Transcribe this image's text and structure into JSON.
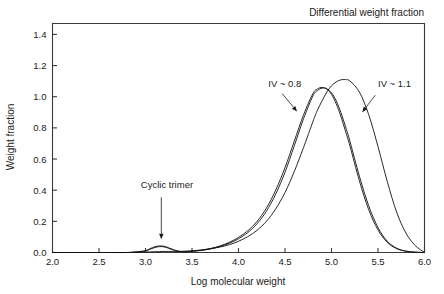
{
  "chart_data": {
    "type": "line",
    "title": "Differential weight fraction",
    "xlabel": "Log molecular weight",
    "ylabel": "Weight fraction",
    "xlim": [
      2.0,
      6.0
    ],
    "ylim": [
      0.0,
      1.47
    ],
    "grid": false,
    "legend_position": "none",
    "xticks": [
      "2.0",
      "2.5",
      "3.0",
      "3.5",
      "4.0",
      "4.5",
      "5.0",
      "5.5",
      "6.0"
    ],
    "xtick_values": [
      2.0,
      2.5,
      3.0,
      3.5,
      4.0,
      4.5,
      5.0,
      5.5,
      6.0
    ],
    "yticks": [
      "0.0",
      "0.2",
      "0.4",
      "0.6",
      "0.8",
      "1.0",
      "1.2",
      "1.4"
    ],
    "ytick_values": [
      0.0,
      0.2,
      0.4,
      0.6,
      0.8,
      1.0,
      1.2,
      1.4
    ],
    "x": [
      2.0,
      2.2,
      2.4,
      2.6,
      2.8,
      2.9,
      3.0,
      3.05,
      3.1,
      3.15,
      3.2,
      3.25,
      3.3,
      3.35,
      3.4,
      3.5,
      3.6,
      3.7,
      3.8,
      3.9,
      4.0,
      4.1,
      4.2,
      4.3,
      4.4,
      4.5,
      4.6,
      4.7,
      4.8,
      4.85,
      4.9,
      4.95,
      5.0,
      5.05,
      5.1,
      5.15,
      5.2,
      5.3,
      5.4,
      5.5,
      5.6,
      5.7,
      5.8,
      5.9,
      6.0
    ],
    "series": [
      {
        "name": "IV ~ 0.8 (a)",
        "label": "IV ~ 0.8",
        "peak_x": 4.88,
        "peak_y": 1.06,
        "values": [
          0.0,
          0.0,
          0.0,
          0.0,
          0.0,
          0.004,
          0.012,
          0.025,
          0.037,
          0.042,
          0.04,
          0.03,
          0.018,
          0.009,
          0.006,
          0.008,
          0.015,
          0.026,
          0.042,
          0.065,
          0.097,
          0.14,
          0.2,
          0.285,
          0.4,
          0.545,
          0.715,
          0.885,
          1.02,
          1.05,
          1.06,
          1.05,
          1.015,
          0.955,
          0.875,
          0.78,
          0.68,
          0.46,
          0.275,
          0.145,
          0.065,
          0.025,
          0.008,
          0.002,
          0.0
        ]
      },
      {
        "name": "IV ~ 0.8 (b)",
        "label": "IV ~ 0.8",
        "peak_x": 4.93,
        "peak_y": 1.055,
        "values": [
          0.0,
          0.0,
          0.0,
          0.0,
          0.0,
          0.003,
          0.01,
          0.021,
          0.032,
          0.038,
          0.036,
          0.027,
          0.016,
          0.008,
          0.005,
          0.007,
          0.013,
          0.023,
          0.038,
          0.059,
          0.088,
          0.128,
          0.185,
          0.265,
          0.375,
          0.515,
          0.685,
          0.86,
          1.005,
          1.04,
          1.055,
          1.05,
          1.025,
          0.975,
          0.9,
          0.81,
          0.71,
          0.49,
          0.3,
          0.16,
          0.072,
          0.028,
          0.009,
          0.002,
          0.0
        ]
      },
      {
        "name": "IV ~ 1.1",
        "label": "IV ~ 1.1",
        "peak_x": 5.12,
        "peak_y": 1.11,
        "values": [
          0.0,
          0.0,
          0.0,
          0.0,
          0.0,
          0.001,
          0.003,
          0.004,
          0.005,
          0.006,
          0.007,
          0.007,
          0.007,
          0.007,
          0.008,
          0.011,
          0.016,
          0.024,
          0.035,
          0.05,
          0.072,
          0.102,
          0.143,
          0.2,
          0.28,
          0.385,
          0.52,
          0.675,
          0.84,
          0.915,
          0.975,
          1.03,
          1.07,
          1.095,
          1.108,
          1.11,
          1.1,
          1.03,
          0.885,
          0.68,
          0.455,
          0.26,
          0.125,
          0.045,
          0.0
        ]
      }
    ],
    "annotations": [
      {
        "id": "iv-08",
        "text": "IV ~ 0.8",
        "label_x": 4.32,
        "label_y": 1.065,
        "arrow_from_x": 4.47,
        "arrow_from_y": 1.02,
        "arrow_to_x": 4.63,
        "arrow_to_y": 0.905
      },
      {
        "id": "iv-11",
        "text": "IV ~ 1.1",
        "label_x": 5.5,
        "label_y": 1.065,
        "arrow_from_x": 5.47,
        "arrow_from_y": 1.01,
        "arrow_to_x": 5.33,
        "arrow_to_y": 0.9
      },
      {
        "id": "cyclic-trimer",
        "text": "Cyclic trimer",
        "label_x": 2.95,
        "label_y": 0.415,
        "arrow_from_x": 3.17,
        "arrow_from_y": 0.355,
        "arrow_to_x": 3.17,
        "arrow_to_y": 0.085
      }
    ]
  }
}
